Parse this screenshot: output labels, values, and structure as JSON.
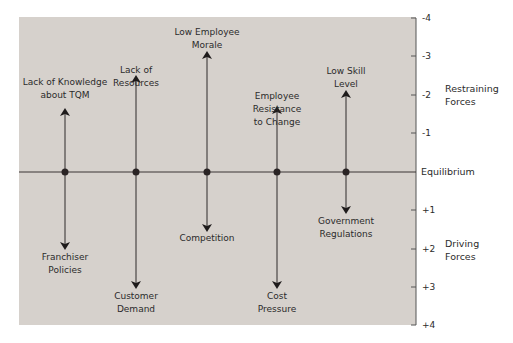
{
  "diagram": {
    "type": "force-field-analysis",
    "equilibrium_label": "Equilibrium",
    "restraining_label": "Restraining\nForces",
    "driving_label": "Driving\nForces",
    "axis_ticks": [
      "-4",
      "-3",
      "-2",
      "-1",
      "+1",
      "+2",
      "+3",
      "+4"
    ],
    "colors": {
      "panel": "#d6d1cc",
      "line": "#2e2a2a",
      "text": "#2b2b2b"
    },
    "forces": [
      {
        "restraining": "Lack of Knowledge\nabout TQM",
        "restraining_strength": 2,
        "driving": "Franchiser\nPolicies",
        "driving_strength": 2
      },
      {
        "restraining": "Lack of\nResources",
        "restraining_strength": 3,
        "driving": "Customer\nDemand",
        "driving_strength": 3
      },
      {
        "restraining": "Low Employee\nMorale",
        "restraining_strength": 3,
        "driving": "Competition",
        "driving_strength": 1.5
      },
      {
        "restraining": "Employee\nResistance\nto Change",
        "restraining_strength": 2,
        "driving": "Cost\nPressure",
        "driving_strength": 3
      },
      {
        "restraining": "Low Skill\nLevel",
        "restraining_strength": 2,
        "driving": "Government\nRegulations",
        "driving_strength": 1
      }
    ]
  }
}
